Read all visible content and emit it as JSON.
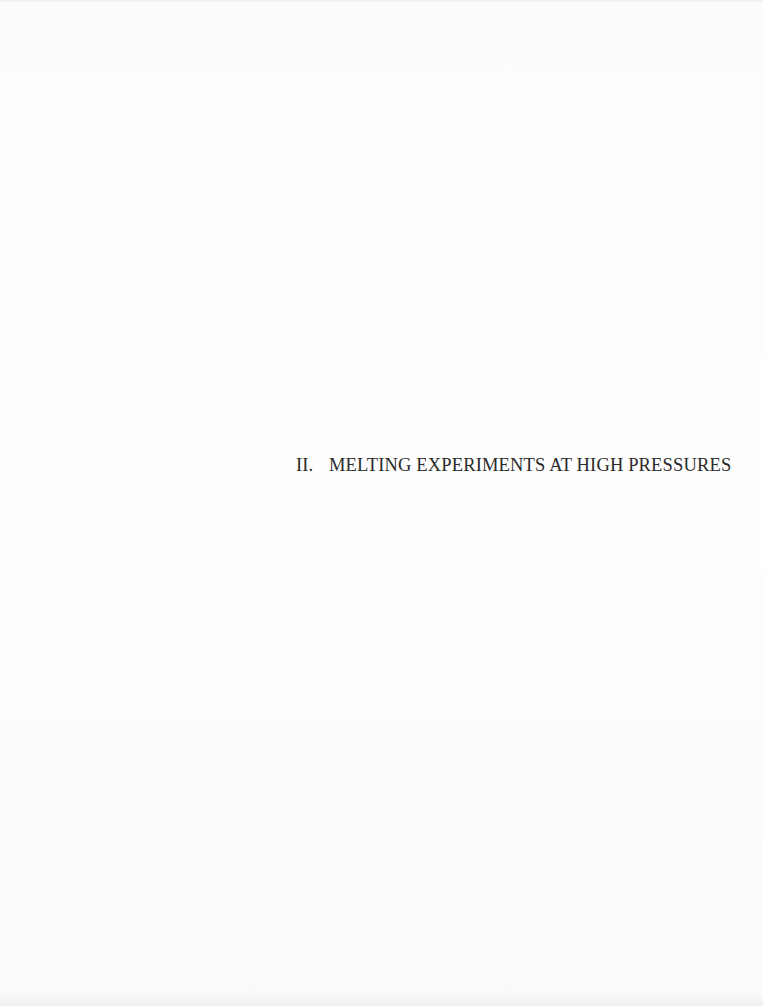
{
  "section": {
    "number": "II.",
    "title": "MELTING EXPERIMENTS AT HIGH PRESSURES"
  }
}
